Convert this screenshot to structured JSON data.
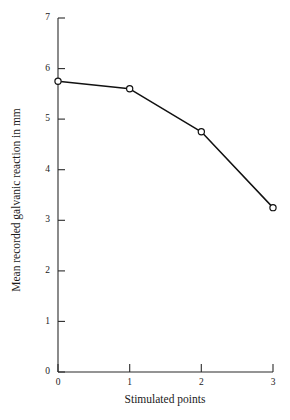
{
  "chart_data": {
    "type": "line",
    "title": "",
    "xlabel": "Stimulated points",
    "ylabel": "Mean recorded galvanic reaction in mm",
    "x": [
      0,
      1,
      2,
      3
    ],
    "values": [
      5.75,
      5.6,
      4.75,
      3.25
    ],
    "xticklabels": [
      "0",
      "1",
      "2",
      "3"
    ],
    "yticklabels": [
      "0",
      "1",
      "2",
      "3",
      "4",
      "5",
      "6",
      "7"
    ],
    "xticks": [
      0,
      1,
      2,
      3
    ],
    "yticks": [
      0,
      1,
      2,
      3,
      4,
      5,
      6,
      7
    ],
    "xlim": [
      0,
      3
    ],
    "ylim": [
      0,
      7
    ],
    "grid": false,
    "legend": false,
    "legend_position": "none",
    "marker": "open-circle",
    "line_color": "#111111",
    "marker_face_color": "#ffffff",
    "marker_edge_color": "#111111",
    "axis_color": "#2b2b2b",
    "background_color": "#ffffff"
  }
}
